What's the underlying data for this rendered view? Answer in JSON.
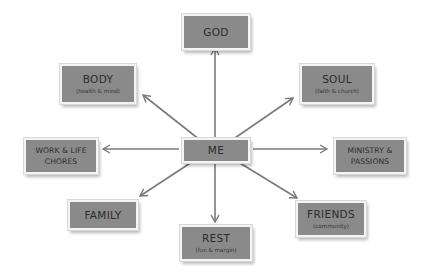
{
  "diagram": {
    "type": "hub-and-spoke",
    "colors": {
      "box_fill": "#8a8a8a",
      "box_border": "#f4f4f4",
      "arrow": "#7a7a7a",
      "text": "#2c2c2c",
      "background": "#ffffff"
    },
    "center": {
      "title": "ME"
    },
    "nodes": {
      "god": {
        "title": "GOD",
        "arrow": "bidirectional"
      },
      "body": {
        "title": "BODY",
        "subtitle": "(health & mind)",
        "arrow": "from-center"
      },
      "soul": {
        "title": "SOUL",
        "subtitle": "(faith & church)",
        "arrow": "from-center"
      },
      "work": {
        "title_line1": "WORK & LIFE",
        "title_line2": "CHORES",
        "arrow": "from-center"
      },
      "ministry": {
        "title_line1": "MINISTRY &",
        "title_line2": "PASSIONS",
        "arrow": "from-center"
      },
      "family": {
        "title": "FAMILY",
        "arrow": "from-center"
      },
      "rest": {
        "title": "REST",
        "subtitle": "(fun & margin)",
        "arrow": "from-center"
      },
      "friends": {
        "title": "FRIENDS",
        "subtitle": "(community)",
        "arrow": "from-center"
      }
    }
  }
}
